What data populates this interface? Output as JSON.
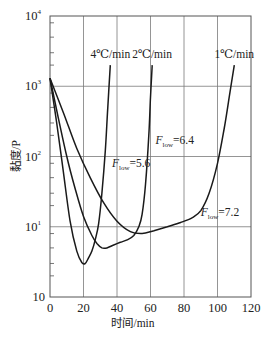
{
  "chart_data": {
    "type": "line",
    "title": "",
    "xlabel": "时间/min",
    "ylabel": "黏度/P",
    "xlim": [
      0,
      120
    ],
    "ylim": [
      1,
      10000
    ],
    "yscale": "log",
    "grid": true,
    "x_ticks": [
      "0",
      "20",
      "40",
      "60",
      "80",
      "100",
      "120"
    ],
    "y_ticks": [
      {
        "value": 10,
        "base": "10",
        "exp": ""
      },
      {
        "value": 10,
        "base": "10",
        "exp": "1"
      },
      {
        "value": 100,
        "base": "10",
        "exp": "2"
      },
      {
        "value": 1000,
        "base": "10",
        "exp": "3"
      },
      {
        "value": 10000,
        "base": "10",
        "exp": "4"
      }
    ],
    "series": [
      {
        "name": "4℃/min",
        "x": [
          0,
          4,
          8,
          12,
          16,
          19,
          21,
          23,
          25,
          27,
          29,
          31,
          33,
          34.5,
          36
        ],
        "y": [
          1300,
          300,
          60,
          12,
          4.5,
          3.1,
          3.0,
          3.6,
          4.5,
          6.5,
          11,
          30,
          120,
          500,
          2000
        ]
      },
      {
        "name": "2℃/min",
        "x": [
          0,
          5,
          10,
          15,
          20,
          25,
          28,
          31,
          34,
          38,
          42,
          46,
          50,
          53,
          55,
          57,
          59,
          60,
          61
        ],
        "y": [
          1300,
          350,
          100,
          35,
          14,
          7.5,
          5.8,
          5.0,
          5.0,
          5.5,
          6.0,
          6.5,
          7.5,
          10,
          15,
          40,
          200,
          700,
          2000
        ]
      },
      {
        "name": "1℃/min",
        "x": [
          0,
          8,
          16,
          24,
          32,
          40,
          48,
          55,
          62,
          70,
          78,
          85,
          90,
          95,
          100,
          104,
          107,
          110
        ],
        "y": [
          1300,
          420,
          130,
          50,
          22,
          12,
          8.5,
          8.0,
          8.8,
          10,
          11.5,
          13.5,
          17,
          30,
          80,
          250,
          700,
          2000
        ]
      }
    ],
    "annotations": [
      {
        "text": "4℃/min",
        "x": 36,
        "y": 2500
      },
      {
        "text": "2℃/min",
        "x": 61,
        "y": 2500
      },
      {
        "text": "1℃/min",
        "x": 110,
        "y": 2500
      },
      {
        "text": "F_low=6.4",
        "main": "F",
        "sub": "low",
        "rest": "=6.4",
        "x": 63,
        "y": 150
      },
      {
        "text": "F_low=5.6",
        "main": "F",
        "sub": "low",
        "rest": "=5.6",
        "x": 37,
        "y": 70
      },
      {
        "text": "F_low=7.2",
        "main": "F",
        "sub": "low",
        "rest": "=7.2",
        "x": 90,
        "y": 14
      }
    ]
  }
}
